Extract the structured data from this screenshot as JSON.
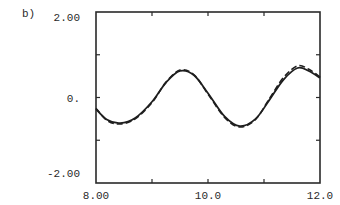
{
  "panel_label": "b)",
  "chart_data": {
    "type": "line",
    "title": "",
    "xlabel": "",
    "ylabel": "",
    "xlim": [
      8.0,
      12.0
    ],
    "ylim": [
      -2.0,
      2.0
    ],
    "grid": false,
    "legend": null,
    "x_tick_labels": [
      {
        "value": 8.0,
        "label": "8.00"
      },
      {
        "value": 10.0,
        "label": "10.0"
      },
      {
        "value": 12.0,
        "label": "12.0"
      }
    ],
    "x_minor_ticks": [
      9.0,
      10.0,
      11.0
    ],
    "y_tick_labels": [
      {
        "value": 2.0,
        "label": "2.00"
      },
      {
        "value": 0.0,
        "label": "0."
      },
      {
        "value": -2.0,
        "label": "-2.00"
      }
    ],
    "y_minor_ticks": [
      1.0,
      0.0,
      -1.0
    ],
    "series": [
      {
        "name": "solid",
        "style": "solid",
        "x": [
          8.0,
          8.2,
          8.43,
          8.7,
          9.0,
          9.25,
          9.5,
          9.75,
          10.0,
          10.3,
          10.57,
          10.85,
          11.1,
          11.35,
          11.6,
          11.8,
          12.0
        ],
        "y": [
          -0.27,
          -0.52,
          -0.6,
          -0.48,
          -0.1,
          0.35,
          0.62,
          0.52,
          0.1,
          -0.45,
          -0.67,
          -0.5,
          -0.05,
          0.42,
          0.69,
          0.62,
          0.46
        ]
      },
      {
        "name": "dashed",
        "style": "dashed",
        "x": [
          8.0,
          8.2,
          8.43,
          8.7,
          9.0,
          9.25,
          9.5,
          9.75,
          10.0,
          10.3,
          10.57,
          10.85,
          11.1,
          11.35,
          11.6,
          11.8,
          12.0
        ],
        "y": [
          -0.25,
          -0.54,
          -0.62,
          -0.5,
          -0.12,
          0.36,
          0.64,
          0.53,
          0.08,
          -0.47,
          -0.69,
          -0.51,
          -0.02,
          0.47,
          0.74,
          0.66,
          0.48
        ]
      }
    ]
  }
}
